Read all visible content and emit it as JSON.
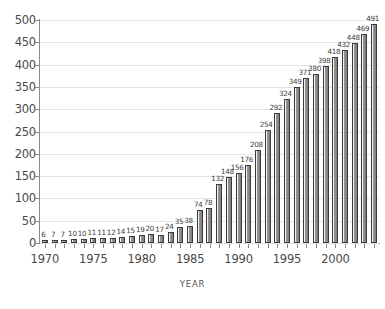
{
  "chart_data": {
    "type": "bar",
    "title": "",
    "xlabel": "YEAR",
    "ylabel": "",
    "ylim": [
      0,
      500
    ],
    "ytick_step": 50,
    "yticks": [
      0,
      50,
      100,
      150,
      200,
      250,
      300,
      350,
      400,
      450,
      500
    ],
    "xticks_major": [
      1970,
      1975,
      1980,
      1985,
      1990,
      1995,
      2000
    ],
    "xtick_minor_every": 1,
    "grid": true,
    "grid_axis": "y",
    "legend": null,
    "bar_value_labels": true,
    "categories": [
      1970,
      1971,
      1972,
      1973,
      1974,
      1975,
      1976,
      1977,
      1978,
      1979,
      1980,
      1981,
      1982,
      1983,
      1984,
      1985,
      1986,
      1987,
      1988,
      1989,
      1990,
      1991,
      1992,
      1993,
      1994,
      1995,
      1996,
      1997,
      1998,
      1999,
      2000,
      2001,
      2002,
      2003,
      2004
    ],
    "values": [
      6,
      7,
      7,
      10,
      10,
      11,
      11,
      12,
      14,
      15,
      19,
      20,
      17,
      24,
      35,
      38,
      74,
      78,
      132,
      148,
      156,
      176,
      208,
      254,
      292,
      324,
      349,
      371,
      380,
      398,
      418,
      432,
      448,
      469,
      491
    ],
    "colors": {
      "bar_light": "#f2f2f2",
      "bar_dark": "#7e7e7e",
      "bar_border": "#3a3a3a",
      "gridline": "#e3e3e3",
      "axis": "#8a8a8a",
      "text": "#4a4a4a",
      "background": "#ffffff"
    }
  }
}
